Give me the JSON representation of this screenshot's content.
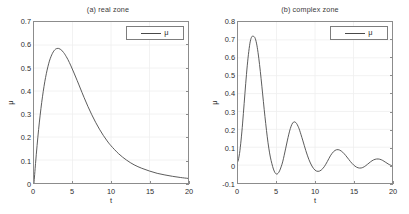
{
  "figure": {
    "width": 409,
    "height": 214,
    "background": "#ffffff",
    "line_color": "#4a4a4a",
    "axis_color": "#8c8c8c",
    "grid_color": "#eeeeee",
    "text_color": "#2e2e2e"
  },
  "chart_data": [
    {
      "type": "line",
      "title": "(a) real zone",
      "xlabel": "t",
      "ylabel": "μ",
      "xlim": [
        0,
        20
      ],
      "ylim": [
        0,
        0.7
      ],
      "xticks": [
        "0",
        "5",
        "10",
        "15",
        "20"
      ],
      "xtick_values": [
        0,
        5,
        10,
        15,
        20
      ],
      "yticks": [
        "0",
        "0.1",
        "0.2",
        "0.3",
        "0.4",
        "0.5",
        "0.6",
        "0.7"
      ],
      "ytick_values": [
        0,
        0.1,
        0.2,
        0.3,
        0.4,
        0.5,
        0.6,
        0.7
      ],
      "grid": true,
      "legend": {
        "position": "top-right",
        "entries": [
          "μ"
        ]
      },
      "series": [
        {
          "name": "μ",
          "x": [
            0,
            0.2,
            0.4,
            0.6,
            0.8,
            1.0,
            1.2,
            1.4,
            1.6,
            1.8,
            2.0,
            2.2,
            2.4,
            2.6,
            2.8,
            3.0,
            3.2,
            3.4,
            3.6,
            3.8,
            4.0,
            4.4,
            4.8,
            5.2,
            5.6,
            6.0,
            6.5,
            7.0,
            7.5,
            8.0,
            8.5,
            9.0,
            9.5,
            10.0,
            11.0,
            12.0,
            13.0,
            14.0,
            15.0,
            16.0,
            17.0,
            18.0,
            19.0,
            20.0
          ],
          "y": [
            0.0,
            0.085,
            0.163,
            0.233,
            0.295,
            0.35,
            0.398,
            0.44,
            0.475,
            0.505,
            0.53,
            0.549,
            0.564,
            0.575,
            0.582,
            0.585,
            0.585,
            0.582,
            0.577,
            0.569,
            0.56,
            0.537,
            0.509,
            0.478,
            0.446,
            0.413,
            0.372,
            0.333,
            0.297,
            0.264,
            0.234,
            0.207,
            0.183,
            0.162,
            0.127,
            0.1,
            0.079,
            0.064,
            0.052,
            0.042,
            0.035,
            0.029,
            0.024,
            0.02
          ]
        }
      ]
    },
    {
      "type": "line",
      "title": "(b) complex zone",
      "xlabel": "t",
      "ylabel": "μ",
      "xlim": [
        0,
        20
      ],
      "ylim": [
        -0.1,
        0.8
      ],
      "xticks": [
        "0",
        "5",
        "10",
        "15",
        "20"
      ],
      "xtick_values": [
        0,
        5,
        10,
        15,
        20
      ],
      "yticks": [
        "-0.1",
        "0",
        "0.1",
        "0.2",
        "0.3",
        "0.4",
        "0.5",
        "0.6",
        "0.7",
        "0.8"
      ],
      "ytick_values": [
        -0.1,
        0,
        0.1,
        0.2,
        0.3,
        0.4,
        0.5,
        0.6,
        0.7,
        0.8
      ],
      "grid": true,
      "legend": {
        "position": "top-right",
        "entries": [
          "μ"
        ]
      },
      "series": [
        {
          "name": "μ",
          "x": [
            0,
            0.2,
            0.4,
            0.6,
            0.8,
            1.0,
            1.2,
            1.4,
            1.6,
            1.8,
            2.0,
            2.2,
            2.4,
            2.6,
            2.8,
            3.0,
            3.2,
            3.4,
            3.6,
            3.8,
            4.0,
            4.2,
            4.4,
            4.6,
            4.8,
            5.0,
            5.2,
            5.4,
            5.6,
            5.8,
            6.0,
            6.2,
            6.4,
            6.6,
            6.8,
            7.0,
            7.2,
            7.4,
            7.6,
            7.8,
            8.0,
            8.4,
            8.8,
            9.2,
            9.6,
            10.0,
            10.4,
            10.8,
            11.2,
            11.6,
            12.0,
            12.4,
            12.8,
            13.2,
            13.6,
            14.0,
            14.4,
            14.8,
            15.2,
            15.6,
            16.0,
            16.4,
            16.8,
            17.2,
            17.6,
            18.0,
            18.4,
            18.8,
            19.2,
            19.6,
            20.0
          ],
          "y": [
            0.02,
            0.065,
            0.14,
            0.235,
            0.345,
            0.455,
            0.555,
            0.635,
            0.693,
            0.718,
            0.72,
            0.712,
            0.682,
            0.63,
            0.562,
            0.483,
            0.398,
            0.312,
            0.232,
            0.158,
            0.095,
            0.045,
            0.008,
            -0.022,
            -0.042,
            -0.05,
            -0.046,
            -0.032,
            -0.01,
            0.018,
            0.055,
            0.095,
            0.135,
            0.173,
            0.205,
            0.228,
            0.24,
            0.241,
            0.233,
            0.217,
            0.195,
            0.14,
            0.082,
            0.032,
            -0.005,
            -0.028,
            -0.035,
            -0.028,
            -0.009,
            0.02,
            0.052,
            0.075,
            0.086,
            0.084,
            0.072,
            0.053,
            0.031,
            0.01,
            -0.006,
            -0.015,
            -0.016,
            -0.009,
            0.004,
            0.018,
            0.029,
            0.034,
            0.033,
            0.026,
            0.015,
            0.004,
            -0.004
          ]
        }
      ]
    }
  ]
}
